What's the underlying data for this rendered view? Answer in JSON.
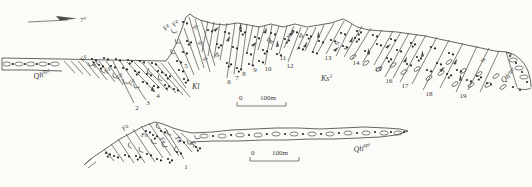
{
  "labels": {
    "dip_angle": "7°",
    "formation_qh_base": "Qh",
    "formation_qh_sup": "apl",
    "formation_kl": "Kl",
    "formation_ks_base": "Ks",
    "formation_ks_sup": "1",
    "fe": "Fe",
    "n_mark": "N",
    "scale_zero": "0",
    "scale_100m": "100m"
  },
  "unit_numbers": [
    {
      "n": "1",
      "x": 186,
      "y": 169
    },
    {
      "n": "2",
      "x": 137,
      "y": 110
    },
    {
      "n": "3",
      "x": 148,
      "y": 105
    },
    {
      "n": "4",
      "x": 158,
      "y": 98
    },
    {
      "n": "5",
      "x": 186,
      "y": 68
    },
    {
      "n": "6",
      "x": 229,
      "y": 84
    },
    {
      "n": "7",
      "x": 237,
      "y": 80
    },
    {
      "n": "8",
      "x": 244,
      "y": 76
    },
    {
      "n": "9",
      "x": 255,
      "y": 72
    },
    {
      "n": "10",
      "x": 268,
      "y": 71
    },
    {
      "n": "11",
      "x": 283,
      "y": 60
    },
    {
      "n": "12",
      "x": 290,
      "y": 68
    },
    {
      "n": "13",
      "x": 328,
      "y": 60
    },
    {
      "n": "14",
      "x": 356,
      "y": 65
    },
    {
      "n": "15",
      "x": 378,
      "y": 71
    },
    {
      "n": "16",
      "x": 389,
      "y": 83
    },
    {
      "n": "17",
      "x": 405,
      "y": 88
    },
    {
      "n": "18",
      "x": 429,
      "y": 96
    },
    {
      "n": "19",
      "x": 463,
      "y": 98
    }
  ],
  "colors": {
    "ink": "#4a4a4a",
    "dot": "#2a2a2a",
    "bg": "#fbfbf8"
  },
  "diagram": {
    "surface_paths": [
      "M2,58 L60,59 L110,60 L166,61 L171,54 L176,44 L181,31 L186,17 L190,14 L194,17 L200,20 L207,22 L215,24 L225,25 L237,23 L249,25 L259,27 L271,24 L283,27 L295,24 L307,27 L319,25 L331,23 L343,19 L349,22 L357,27 L369,30 L383,31 L397,32 L411,34 L425,36 L439,39 L453,42 L467,45 L481,48 L495,51 L506,52 L512,55",
      "M2,58 L2,70",
      "M2,70 L30,70 L62,71",
      "M84,165 L92,158 L120,139 L142,127 L155,122 L163,124 L173,128 L183,131 L192,133 L212,132 L232,130 L254,129 L276,128 L298,128 L320,129 L342,128 L364,127 L386,128 L400,129 L408,131",
      "M190,142 L214,141 L238,141 L262,140 L286,140 L310,139 L334,139 L358,138 L380,137 L396,135 L408,131",
      "M506,52 C515,53 524,61 528,71 C530,77 531,82 531,87",
      "M517,88 C522,90 527,90 531,88"
    ],
    "bed_lines_top": [
      [
        64,
        61,
        75,
        73
      ],
      [
        71,
        61,
        83,
        74
      ],
      [
        78,
        61,
        91,
        76
      ],
      [
        85,
        61,
        99,
        78
      ],
      [
        92,
        61,
        107,
        80
      ],
      [
        99,
        61,
        115,
        82
      ],
      [
        106,
        61,
        123,
        85
      ],
      [
        113,
        61,
        134,
        103
      ],
      [
        120,
        61,
        146,
        100
      ],
      [
        127,
        62,
        155,
        92
      ],
      [
        134,
        62,
        160,
        88
      ],
      [
        141,
        62,
        168,
        91
      ],
      [
        148,
        62,
        176,
        93
      ],
      [
        155,
        63,
        183,
        95
      ],
      [
        161,
        63,
        190,
        97
      ],
      [
        168,
        62,
        186,
        88
      ],
      [
        174,
        50,
        189,
        81
      ],
      [
        179,
        39,
        194,
        75
      ],
      [
        184,
        28,
        199,
        70
      ],
      [
        189,
        17,
        204,
        68
      ],
      [
        195,
        19,
        210,
        72
      ],
      [
        201,
        20,
        215,
        66
      ],
      [
        208,
        21,
        202,
        52
      ],
      [
        214,
        22,
        208,
        56
      ],
      [
        220,
        23,
        214,
        58
      ],
      [
        227,
        23,
        220,
        60
      ],
      [
        235,
        23,
        227,
        78
      ],
      [
        241,
        23,
        234,
        74
      ],
      [
        247,
        24,
        241,
        70
      ],
      [
        253,
        25,
        247,
        52
      ],
      [
        259,
        26,
        252,
        66
      ],
      [
        265,
        26,
        258,
        50
      ],
      [
        272,
        25,
        265,
        65
      ],
      [
        279,
        26,
        271,
        50
      ],
      [
        287,
        26,
        279,
        54
      ],
      [
        294,
        26,
        284,
        48
      ],
      [
        301,
        27,
        288,
        62
      ],
      [
        308,
        28,
        297,
        50
      ],
      [
        316,
        27,
        305,
        51
      ],
      [
        324,
        25,
        312,
        53
      ],
      [
        334,
        23,
        318,
        52
      ],
      [
        344,
        21,
        326,
        54
      ],
      [
        352,
        24,
        336,
        56
      ],
      [
        362,
        26,
        344,
        57
      ],
      [
        371,
        28,
        352,
        59
      ],
      [
        382,
        30,
        363,
        62
      ],
      [
        393,
        31,
        374,
        65
      ],
      [
        401,
        32,
        379,
        70
      ],
      [
        409,
        33,
        385,
        77
      ],
      [
        417,
        34,
        393,
        78
      ],
      [
        426,
        35,
        400,
        82
      ],
      [
        437,
        37,
        412,
        84
      ],
      [
        449,
        40,
        423,
        90
      ],
      [
        463,
        43,
        440,
        88
      ],
      [
        477,
        46,
        456,
        92
      ],
      [
        489,
        48,
        468,
        90
      ],
      [
        499,
        51,
        480,
        92
      ],
      [
        506,
        52,
        517,
        87
      ]
    ],
    "bed_lines_bottom": [
      [
        104,
        149,
        114,
        161
      ],
      [
        111,
        144,
        124,
        162
      ],
      [
        118,
        139,
        134,
        163
      ],
      [
        126,
        134,
        145,
        163
      ],
      [
        133,
        129,
        155,
        162
      ],
      [
        141,
        126,
        163,
        158
      ],
      [
        149,
        123,
        171,
        156
      ],
      [
        157,
        124,
        179,
        156
      ],
      [
        165,
        128,
        184,
        159
      ],
      [
        173,
        130,
        192,
        152
      ],
      [
        181,
        133,
        198,
        149
      ],
      [
        92,
        158,
        84,
        165
      ],
      [
        96,
        162,
        88,
        168
      ]
    ],
    "band_top": {
      "ellipses": [
        [
          7,
          64
        ],
        [
          19,
          64
        ],
        [
          31,
          64
        ],
        [
          43,
          64
        ],
        [
          55,
          64
        ]
      ],
      "dots": [
        [
          13,
          64
        ],
        [
          25,
          64
        ],
        [
          37,
          64
        ],
        [
          49,
          64
        ]
      ]
    },
    "band_bottom": {
      "ellipses": [
        [
          204,
          136
        ],
        [
          222,
          136
        ],
        [
          240,
          135
        ],
        [
          258,
          135
        ],
        [
          276,
          134
        ],
        [
          294,
          134
        ],
        [
          312,
          134
        ],
        [
          330,
          134
        ],
        [
          348,
          133
        ],
        [
          366,
          133
        ],
        [
          384,
          133
        ],
        [
          398,
          133
        ]
      ],
      "dots": [
        [
          213,
          136
        ],
        [
          231,
          135
        ],
        [
          249,
          135
        ],
        [
          267,
          134
        ],
        [
          285,
          134
        ],
        [
          303,
          134
        ],
        [
          321,
          134
        ],
        [
          339,
          133
        ],
        [
          357,
          133
        ],
        [
          375,
          132
        ],
        [
          391,
          132
        ],
        [
          404,
          132
        ]
      ]
    },
    "pocket": {
      "ellipses": [
        [
          513,
          60
        ],
        [
          519,
          68
        ],
        [
          524,
          77
        ]
      ],
      "dots": [
        [
          510,
          56
        ],
        [
          516,
          63
        ],
        [
          522,
          72
        ],
        [
          527,
          82
        ],
        [
          513,
          87
        ],
        [
          520,
          90
        ]
      ]
    },
    "dot_clusters": [
      [
        92,
        59
      ],
      [
        104,
        58
      ],
      [
        116,
        59
      ],
      [
        128,
        60
      ],
      [
        140,
        61
      ],
      [
        152,
        63
      ],
      [
        99,
        65
      ],
      [
        111,
        66
      ],
      [
        123,
        68
      ],
      [
        135,
        71
      ],
      [
        147,
        74
      ],
      [
        158,
        71
      ],
      [
        166,
        75
      ],
      [
        143,
        82
      ],
      [
        154,
        86
      ],
      [
        165,
        85
      ],
      [
        174,
        89
      ],
      [
        179,
        70
      ],
      [
        184,
        79
      ],
      [
        177,
        61
      ],
      [
        183,
        52
      ],
      [
        187,
        41
      ],
      [
        183,
        22
      ],
      [
        208,
        30
      ],
      [
        217,
        44
      ],
      [
        225,
        32
      ],
      [
        233,
        47
      ],
      [
        241,
        31
      ],
      [
        247,
        53
      ],
      [
        255,
        37
      ],
      [
        263,
        50
      ],
      [
        271,
        33
      ],
      [
        277,
        54
      ],
      [
        285,
        39
      ],
      [
        293,
        31
      ],
      [
        299,
        48
      ],
      [
        307,
        35
      ],
      [
        313,
        52
      ],
      [
        319,
        41
      ],
      [
        227,
        63
      ],
      [
        249,
        64
      ],
      [
        259,
        61
      ],
      [
        237,
        68
      ],
      [
        331,
        40
      ],
      [
        343,
        46
      ],
      [
        355,
        38
      ],
      [
        365,
        51
      ],
      [
        377,
        44
      ],
      [
        387,
        58
      ],
      [
        397,
        50
      ],
      [
        407,
        64
      ],
      [
        417,
        57
      ],
      [
        427,
        70
      ],
      [
        437,
        63
      ],
      [
        447,
        74
      ],
      [
        457,
        70
      ],
      [
        467,
        80
      ],
      [
        477,
        76
      ],
      [
        487,
        83
      ],
      [
        341,
        33
      ],
      [
        357,
        31
      ],
      [
        373,
        35
      ],
      [
        391,
        39
      ],
      [
        411,
        43
      ],
      [
        431,
        47
      ],
      [
        449,
        53
      ],
      [
        106,
        153
      ],
      [
        114,
        156
      ],
      [
        125,
        155
      ],
      [
        136,
        156
      ],
      [
        147,
        154
      ],
      [
        157,
        159
      ],
      [
        168,
        159
      ],
      [
        177,
        152
      ],
      [
        146,
        131
      ],
      [
        153,
        135
      ],
      [
        161,
        131
      ],
      [
        180,
        141
      ],
      [
        196,
        147
      ]
    ],
    "open_ellipses": [
      [
        353,
        57
      ],
      [
        366,
        63
      ],
      [
        379,
        69
      ],
      [
        393,
        65
      ],
      [
        404,
        72
      ],
      [
        417,
        69
      ],
      [
        429,
        78
      ],
      [
        441,
        73
      ],
      [
        449,
        62
      ],
      [
        455,
        84
      ],
      [
        463,
        71
      ],
      [
        471,
        85
      ],
      [
        479,
        74
      ],
      [
        488,
        85
      ],
      [
        496,
        76
      ],
      [
        503,
        87
      ]
    ],
    "fe_labels": [
      [
        83,
        62,
        -50
      ],
      [
        95,
        68,
        -50
      ],
      [
        107,
        74,
        -50
      ],
      [
        119,
        80,
        -50
      ],
      [
        131,
        86,
        -50
      ],
      [
        166,
        31,
        -55
      ],
      [
        175,
        27,
        -55
      ],
      [
        124,
        131,
        -40
      ],
      [
        141,
        137,
        0
      ],
      [
        159,
        139,
        52
      ],
      [
        175,
        138,
        55
      ],
      [
        190,
        143,
        55
      ]
    ],
    "n_marks": [
      [
        196,
        30
      ],
      [
        201,
        46
      ],
      [
        206,
        62
      ],
      [
        272,
        45
      ],
      [
        290,
        39
      ],
      [
        338,
        46
      ],
      [
        347,
        51
      ],
      [
        484,
        63
      ]
    ],
    "l_marks": [
      [
        90,
        66
      ],
      [
        101,
        71
      ],
      [
        113,
        77
      ],
      [
        124,
        83
      ],
      [
        135,
        88
      ],
      [
        147,
        72
      ],
      [
        158,
        79
      ],
      [
        171,
        53
      ],
      [
        176,
        43
      ],
      [
        173,
        33
      ],
      [
        128,
        146
      ],
      [
        139,
        151
      ],
      [
        152,
        143
      ],
      [
        163,
        147
      ],
      [
        174,
        150
      ],
      [
        156,
        127
      ],
      [
        167,
        134
      ],
      [
        188,
        144
      ],
      [
        196,
        139
      ]
    ],
    "flags": [
      [
        213,
        30
      ],
      [
        226,
        41
      ],
      [
        239,
        30
      ],
      [
        251,
        45
      ],
      [
        263,
        33
      ],
      [
        276,
        47
      ],
      [
        289,
        34
      ],
      [
        303,
        47
      ],
      [
        317,
        38
      ],
      [
        333,
        50
      ],
      [
        349,
        42
      ],
      [
        367,
        55
      ],
      [
        385,
        47
      ],
      [
        403,
        62
      ],
      [
        421,
        57
      ],
      [
        439,
        70
      ],
      [
        453,
        64
      ],
      [
        459,
        81
      ]
    ],
    "triangles": [
      [
        215,
        56
      ],
      [
        267,
        41
      ],
      [
        299,
        37
      ]
    ],
    "arrowheads": [
      [
        155,
        92,
        48
      ]
    ],
    "scale_bars": [
      {
        "x1": 237,
        "x2": 286,
        "y": 106,
        "zx": 239,
        "lx": 260,
        "ty": 100
      },
      {
        "x1": 250,
        "x2": 299,
        "y": 161,
        "zx": 251,
        "lx": 272,
        "ty": 155
      }
    ]
  }
}
